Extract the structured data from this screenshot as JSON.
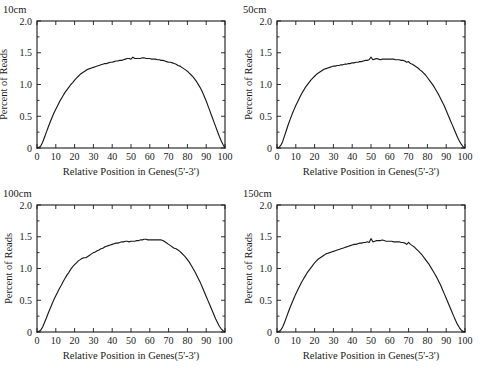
{
  "figure": {
    "background_color": "#ffffff",
    "line_color": "#1a1a1a",
    "panel_count": 4
  },
  "chart_data": [
    {
      "type": "line",
      "title": "10cm",
      "xlabel": "Relative Position in Genes(5'-3')",
      "ylabel": "Percent of Reads",
      "xlim": [
        0,
        100
      ],
      "ylim": [
        0,
        2.0
      ],
      "xticks": [
        0,
        10,
        20,
        30,
        40,
        50,
        60,
        70,
        80,
        90,
        100
      ],
      "xticklabels": [
        "0",
        "10",
        "20",
        "30",
        "40",
        "50",
        "60",
        "70",
        "80",
        "90",
        "100"
      ],
      "yticks": [
        0,
        0.5,
        1.0,
        1.5,
        2.0
      ],
      "yticklabels": [
        "0",
        "0.5",
        "1.0",
        "1.5",
        "2.0"
      ],
      "grid": false,
      "legend": "none",
      "x": [
        0,
        1,
        2,
        3,
        4,
        5,
        6,
        7,
        8,
        9,
        10,
        11,
        12,
        13,
        14,
        15,
        16,
        17,
        18,
        19,
        20,
        21,
        22,
        23,
        24,
        25,
        26,
        27,
        28,
        29,
        30,
        31,
        32,
        33,
        34,
        35,
        36,
        37,
        38,
        39,
        40,
        41,
        42,
        43,
        44,
        45,
        46,
        47,
        48,
        49,
        50,
        51,
        52,
        53,
        54,
        55,
        56,
        57,
        58,
        59,
        60,
        61,
        62,
        63,
        64,
        65,
        66,
        67,
        68,
        69,
        70,
        71,
        72,
        73,
        74,
        75,
        76,
        77,
        78,
        79,
        80,
        81,
        82,
        83,
        84,
        85,
        86,
        87,
        88,
        89,
        90,
        91,
        92,
        93,
        94,
        95,
        96,
        97,
        98,
        99,
        100
      ],
      "y": [
        0.0,
        0.01,
        0.03,
        0.09,
        0.17,
        0.25,
        0.33,
        0.41,
        0.48,
        0.55,
        0.61,
        0.67,
        0.73,
        0.78,
        0.83,
        0.88,
        0.92,
        0.96,
        1.0,
        1.03,
        1.07,
        1.1,
        1.13,
        1.16,
        1.18,
        1.2,
        1.22,
        1.24,
        1.25,
        1.26,
        1.27,
        1.28,
        1.29,
        1.3,
        1.31,
        1.32,
        1.33,
        1.33,
        1.34,
        1.35,
        1.35,
        1.36,
        1.37,
        1.37,
        1.38,
        1.38,
        1.39,
        1.4,
        1.41,
        1.41,
        1.4,
        1.43,
        1.41,
        1.41,
        1.41,
        1.41,
        1.42,
        1.42,
        1.41,
        1.41,
        1.41,
        1.4,
        1.4,
        1.4,
        1.39,
        1.39,
        1.38,
        1.38,
        1.37,
        1.36,
        1.35,
        1.35,
        1.34,
        1.33,
        1.32,
        1.3,
        1.29,
        1.27,
        1.25,
        1.23,
        1.21,
        1.18,
        1.15,
        1.12,
        1.08,
        1.04,
        0.99,
        0.94,
        0.88,
        0.81,
        0.74,
        0.66,
        0.58,
        0.5,
        0.42,
        0.34,
        0.26,
        0.18,
        0.11,
        0.05,
        0.0
      ]
    },
    {
      "type": "line",
      "title": "50cm",
      "xlabel": "Relative Position in Genes(5'-3')",
      "ylabel": "Percent of Reads",
      "xlim": [
        0,
        100
      ],
      "ylim": [
        0,
        2.0
      ],
      "xticks": [
        0,
        10,
        20,
        30,
        40,
        50,
        60,
        70,
        80,
        90,
        100
      ],
      "xticklabels": [
        "0",
        "10",
        "20",
        "30",
        "40",
        "50",
        "60",
        "70",
        "80",
        "90",
        "100"
      ],
      "yticks": [
        0,
        0.5,
        1.0,
        1.5,
        2.0
      ],
      "yticklabels": [
        "0",
        "0.5",
        "1.0",
        "1.5",
        "2.0"
      ],
      "grid": false,
      "legend": "none",
      "x": [
        0,
        1,
        2,
        3,
        4,
        5,
        6,
        7,
        8,
        9,
        10,
        11,
        12,
        13,
        14,
        15,
        16,
        17,
        18,
        19,
        20,
        21,
        22,
        23,
        24,
        25,
        26,
        27,
        28,
        29,
        30,
        31,
        32,
        33,
        34,
        35,
        36,
        37,
        38,
        39,
        40,
        41,
        42,
        43,
        44,
        45,
        46,
        47,
        48,
        49,
        50,
        51,
        52,
        53,
        54,
        55,
        56,
        57,
        58,
        59,
        60,
        61,
        62,
        63,
        64,
        65,
        66,
        67,
        68,
        69,
        70,
        71,
        72,
        73,
        74,
        75,
        76,
        77,
        78,
        79,
        80,
        81,
        82,
        83,
        84,
        85,
        86,
        87,
        88,
        89,
        90,
        91,
        92,
        93,
        94,
        95,
        96,
        97,
        98,
        99,
        100
      ],
      "y": [
        0.0,
        0.01,
        0.04,
        0.1,
        0.19,
        0.28,
        0.37,
        0.45,
        0.53,
        0.6,
        0.67,
        0.73,
        0.79,
        0.85,
        0.9,
        0.95,
        0.99,
        1.03,
        1.07,
        1.1,
        1.13,
        1.16,
        1.18,
        1.2,
        1.22,
        1.24,
        1.25,
        1.26,
        1.27,
        1.28,
        1.29,
        1.29,
        1.3,
        1.3,
        1.31,
        1.31,
        1.32,
        1.32,
        1.33,
        1.33,
        1.34,
        1.34,
        1.35,
        1.35,
        1.36,
        1.36,
        1.37,
        1.38,
        1.38,
        1.39,
        1.43,
        1.39,
        1.4,
        1.41,
        1.4,
        1.39,
        1.4,
        1.4,
        1.4,
        1.4,
        1.4,
        1.4,
        1.4,
        1.39,
        1.39,
        1.39,
        1.38,
        1.38,
        1.37,
        1.35,
        1.36,
        1.33,
        1.32,
        1.3,
        1.28,
        1.26,
        1.23,
        1.21,
        1.18,
        1.15,
        1.11,
        1.07,
        1.03,
        0.99,
        0.94,
        0.89,
        0.84,
        0.78,
        0.72,
        0.66,
        0.59,
        0.52,
        0.45,
        0.38,
        0.31,
        0.24,
        0.17,
        0.11,
        0.06,
        0.02,
        0.0
      ]
    },
    {
      "type": "line",
      "title": "100cm",
      "xlabel": "Relative Position in Genes(5'-3')",
      "ylabel": "Percent of Reads",
      "xlim": [
        0,
        100
      ],
      "ylim": [
        0,
        2.0
      ],
      "xticks": [
        0,
        10,
        20,
        30,
        40,
        50,
        60,
        70,
        80,
        90,
        100
      ],
      "xticklabels": [
        "0",
        "10",
        "20",
        "30",
        "40",
        "50",
        "60",
        "70",
        "80",
        "90",
        "100"
      ],
      "yticks": [
        0,
        0.5,
        1.0,
        1.5,
        2.0
      ],
      "yticklabels": [
        "0",
        "0.5",
        "1.0",
        "1.5",
        "2.0"
      ],
      "grid": false,
      "legend": "none",
      "x": [
        0,
        1,
        2,
        3,
        4,
        5,
        6,
        7,
        8,
        9,
        10,
        11,
        12,
        13,
        14,
        15,
        16,
        17,
        18,
        19,
        20,
        21,
        22,
        23,
        24,
        25,
        26,
        27,
        28,
        29,
        30,
        31,
        32,
        33,
        34,
        35,
        36,
        37,
        38,
        39,
        40,
        41,
        42,
        43,
        44,
        45,
        46,
        47,
        48,
        49,
        50,
        51,
        52,
        53,
        54,
        55,
        56,
        57,
        58,
        59,
        60,
        61,
        62,
        63,
        64,
        65,
        66,
        67,
        68,
        69,
        70,
        71,
        72,
        73,
        74,
        75,
        76,
        77,
        78,
        79,
        80,
        81,
        82,
        83,
        84,
        85,
        86,
        87,
        88,
        89,
        90,
        91,
        92,
        93,
        94,
        95,
        96,
        97,
        98,
        99,
        100
      ],
      "y": [
        0.0,
        0.01,
        0.03,
        0.08,
        0.15,
        0.22,
        0.3,
        0.37,
        0.44,
        0.51,
        0.57,
        0.63,
        0.69,
        0.74,
        0.8,
        0.85,
        0.9,
        0.94,
        0.99,
        1.03,
        1.06,
        1.09,
        1.12,
        1.14,
        1.16,
        1.17,
        1.17,
        1.19,
        1.21,
        1.23,
        1.25,
        1.26,
        1.28,
        1.29,
        1.31,
        1.32,
        1.34,
        1.35,
        1.36,
        1.37,
        1.38,
        1.39,
        1.4,
        1.4,
        1.41,
        1.42,
        1.42,
        1.43,
        1.43,
        1.42,
        1.43,
        1.43,
        1.43,
        1.44,
        1.44,
        1.45,
        1.45,
        1.46,
        1.46,
        1.45,
        1.45,
        1.45,
        1.45,
        1.45,
        1.45,
        1.45,
        1.45,
        1.44,
        1.42,
        1.4,
        1.38,
        1.36,
        1.34,
        1.32,
        1.31,
        1.29,
        1.27,
        1.24,
        1.21,
        1.18,
        1.14,
        1.1,
        1.05,
        1.0,
        0.95,
        0.89,
        0.83,
        0.77,
        0.7,
        0.63,
        0.56,
        0.49,
        0.42,
        0.35,
        0.28,
        0.21,
        0.15,
        0.09,
        0.05,
        0.02,
        0.0
      ]
    },
    {
      "type": "line",
      "title": "150cm",
      "xlabel": "Relative Position in Genes(5'-3')",
      "ylabel": "Percent of Reads",
      "xlim": [
        0,
        100
      ],
      "ylim": [
        0,
        2.0
      ],
      "xticks": [
        0,
        10,
        20,
        30,
        40,
        50,
        60,
        70,
        80,
        90,
        100
      ],
      "xticklabels": [
        "0",
        "10",
        "20",
        "30",
        "40",
        "50",
        "60",
        "70",
        "80",
        "90",
        "100"
      ],
      "yticks": [
        0,
        0.5,
        1.0,
        1.5,
        2.0
      ],
      "yticklabels": [
        "0",
        "0.5",
        "1.0",
        "1.5",
        "2.0"
      ],
      "grid": false,
      "legend": "none",
      "x": [
        0,
        1,
        2,
        3,
        4,
        5,
        6,
        7,
        8,
        9,
        10,
        11,
        12,
        13,
        14,
        15,
        16,
        17,
        18,
        19,
        20,
        21,
        22,
        23,
        24,
        25,
        26,
        27,
        28,
        29,
        30,
        31,
        32,
        33,
        34,
        35,
        36,
        37,
        38,
        39,
        40,
        41,
        42,
        43,
        44,
        45,
        46,
        47,
        48,
        49,
        50,
        51,
        52,
        53,
        54,
        55,
        56,
        57,
        58,
        59,
        60,
        61,
        62,
        63,
        64,
        65,
        66,
        67,
        68,
        69,
        70,
        71,
        72,
        73,
        74,
        75,
        76,
        77,
        78,
        79,
        80,
        81,
        82,
        83,
        84,
        85,
        86,
        87,
        88,
        89,
        90,
        91,
        92,
        93,
        94,
        95,
        96,
        97,
        98,
        99,
        100
      ],
      "y": [
        0.0,
        0.01,
        0.03,
        0.08,
        0.15,
        0.23,
        0.31,
        0.39,
        0.46,
        0.53,
        0.6,
        0.66,
        0.72,
        0.78,
        0.83,
        0.88,
        0.93,
        0.97,
        1.01,
        1.05,
        1.09,
        1.12,
        1.15,
        1.17,
        1.19,
        1.21,
        1.23,
        1.24,
        1.25,
        1.26,
        1.27,
        1.28,
        1.29,
        1.3,
        1.31,
        1.32,
        1.33,
        1.34,
        1.35,
        1.36,
        1.37,
        1.38,
        1.38,
        1.39,
        1.4,
        1.4,
        1.41,
        1.41,
        1.42,
        1.41,
        1.47,
        1.42,
        1.43,
        1.44,
        1.44,
        1.44,
        1.45,
        1.44,
        1.43,
        1.43,
        1.43,
        1.43,
        1.42,
        1.42,
        1.42,
        1.42,
        1.41,
        1.41,
        1.4,
        1.38,
        1.41,
        1.38,
        1.36,
        1.34,
        1.31,
        1.28,
        1.25,
        1.22,
        1.18,
        1.14,
        1.1,
        1.06,
        1.01,
        0.96,
        0.91,
        0.86,
        0.8,
        0.74,
        0.67,
        0.6,
        0.53,
        0.46,
        0.39,
        0.32,
        0.25,
        0.18,
        0.12,
        0.07,
        0.03,
        0.01,
        0.0
      ]
    }
  ]
}
